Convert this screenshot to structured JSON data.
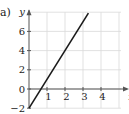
{
  "part_label": "a)",
  "chart_data": {
    "type": "line",
    "title": "",
    "xlabel": "x",
    "ylabel": "y",
    "x_ticks": [
      1,
      2,
      3,
      4
    ],
    "y_ticks": [
      -2,
      0,
      2,
      4,
      6
    ],
    "xlim": [
      0,
      5
    ],
    "ylim": [
      -2,
      8
    ],
    "grid": true,
    "series": [
      {
        "name": "y = 3x - 2",
        "x": [
          0,
          3.3
        ],
        "y": [
          -2,
          7.9
        ]
      }
    ],
    "colors": {
      "line": "#1a1a1a",
      "grid": "#d9d9d9",
      "axis": "#555555"
    }
  }
}
